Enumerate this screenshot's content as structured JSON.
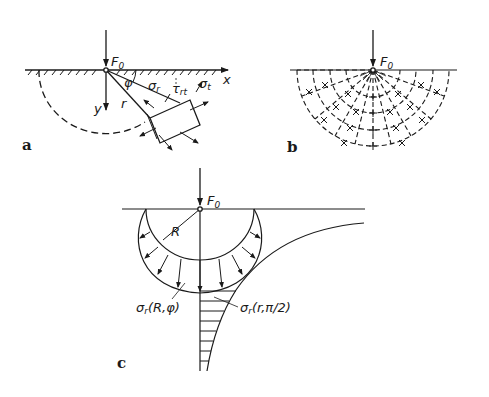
{
  "figure": {
    "panels": [
      {
        "id": "a",
        "label": "a",
        "force": "F",
        "force_sub": "0",
        "axis_x": "x",
        "axis_y": "y",
        "radius": "r",
        "angle": "φ",
        "stresses": [
          "σ",
          "τ",
          "σ"
        ],
        "stress_subs": [
          "r",
          "rt",
          "t"
        ]
      },
      {
        "id": "b",
        "label": "b",
        "force": "F",
        "force_sub": "0"
      },
      {
        "id": "c",
        "label": "c",
        "force": "F",
        "force_sub": "0",
        "radius": "R",
        "stress_circle": "(R,φ)",
        "stress_axis": "(r,π/2)",
        "sigma": "σ",
        "sigma_sub": "r"
      }
    ]
  }
}
